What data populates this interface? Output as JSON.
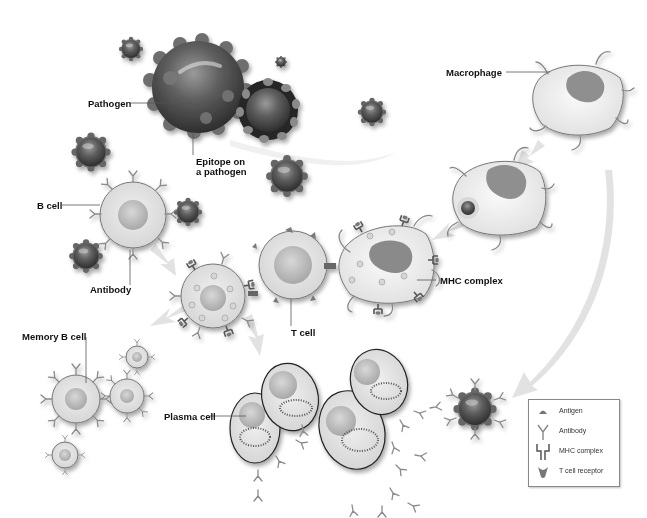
{
  "diagram": {
    "colors": {
      "pathogen_dark": "#3a3a3a",
      "pathogen_mid": "#6a6a6a",
      "cell_fill": "#e6e6e6",
      "nucleus": "#bdbdbd",
      "macrophage_nucleus": "#8a8a8a",
      "arrow": "#e4e4e4",
      "label_text": "#111111"
    },
    "labels": {
      "pathogen": "Pathogen",
      "epitope_line1": "Epitope on",
      "epitope_line2": "a pathogen",
      "macrophage": "Macrophage",
      "b_cell": "B cell",
      "antibody": "Antibody",
      "mhc_complex": "MHC complex",
      "t_cell": "T cell",
      "memory_b_cell": "Memory B cell",
      "plasma_cell": "Plasma cell"
    },
    "stages": [
      {
        "name": "Pathogen with epitopes"
      },
      {
        "name": "Macrophage engulfs pathogen"
      },
      {
        "name": "Macrophage presents antigen via MHC complex"
      },
      {
        "name": "T cell activates B cell"
      },
      {
        "name": "B cell becomes memory B cells and plasma cells"
      },
      {
        "name": "Plasma cells release antibodies that tag pathogen"
      }
    ]
  },
  "legend": {
    "items": [
      {
        "icon": "antigen-icon",
        "label": "Antigen"
      },
      {
        "icon": "antibody-icon",
        "label": "Antibody"
      },
      {
        "icon": "mhc-complex-icon",
        "label": "MHC complex"
      },
      {
        "icon": "t-cell-receptor-icon",
        "label": "T cell receptor"
      }
    ]
  }
}
